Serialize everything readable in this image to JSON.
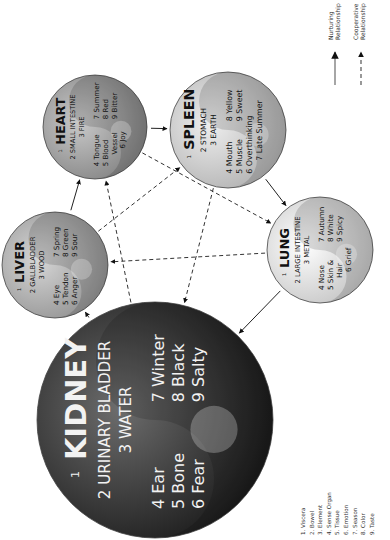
{
  "diagram": {
    "type": "five-element-viscera-diagram",
    "orientation": "rotated-90-ccw",
    "organs": [
      {
        "id": "heart",
        "viscera": "HEART",
        "bowel": "SMALL INTESTINE",
        "element": "FIRE",
        "sense_organ": "Tongue",
        "tissue": "Blood Vessel",
        "tissue_l1": "Blood",
        "tissue_l2": "Vessel",
        "emotion": "Joy",
        "season": "Summer",
        "color": "Red",
        "taste": "Bitter",
        "cx": 95,
        "cy": 127,
        "r": 52,
        "shade_light": "#c9c9c9",
        "shade_dark": "#7a7a7a",
        "text_color": "#111111"
      },
      {
        "id": "spleen",
        "viscera": "SPLEEN",
        "bowel": "STOMACH",
        "element": "EARTH",
        "sense_organ": "Mouth",
        "tissue": "Muscle",
        "emotion": "Overthinking",
        "season": "Late Summer",
        "color": "Yellow",
        "taste": "Sweet",
        "cx": 228,
        "cy": 130,
        "r": 58,
        "shade_light": "#eeeeee",
        "shade_dark": "#a9a9a9",
        "text_color": "#111111"
      },
      {
        "id": "liver",
        "viscera": "LIVER",
        "bowel": "GALLBLADDER",
        "element": "WOOD",
        "sense_organ": "Eye",
        "tissue": "Tendon",
        "emotion": "Anger",
        "season": "Spring",
        "color": "Green",
        "taste": "Sour",
        "cx": 55,
        "cy": 265,
        "r": 53,
        "shade_light": "#d6d6d6",
        "shade_dark": "#8a8a8a",
        "text_color": "#111111"
      },
      {
        "id": "lung",
        "viscera": "LUNG",
        "bowel": "LARGE INTESTINE",
        "element": "METAL",
        "sense_organ": "Nose",
        "tissue": "Skin & Hair",
        "tissue_l1": "Skin &",
        "tissue_l2": "Hair",
        "emotion": "Grief",
        "season": "Autumn",
        "color": "White",
        "taste": "Spicy",
        "cx": 320,
        "cy": 250,
        "r": 53,
        "shade_light": "#ffffff",
        "shade_dark": "#bdbdbd",
        "text_color": "#111111"
      },
      {
        "id": "kidney",
        "viscera": "KIDNEY",
        "bowel": "URINARY BLADDER",
        "element": "WATER",
        "sense_organ": "Ear",
        "tissue": "Bone",
        "emotion": "Fear",
        "season": "Winter",
        "color": "Black",
        "taste": "Salty",
        "cx": 155,
        "cy": 420,
        "r": 118,
        "shade_light": "#6d6d6d",
        "shade_dark": "#0f0f0f",
        "text_color": "#f2f2f2"
      }
    ],
    "nurturing_arrows": [
      {
        "from": "kidney",
        "to": "liver"
      },
      {
        "from": "liver",
        "to": "heart"
      },
      {
        "from": "heart",
        "to": "spleen"
      },
      {
        "from": "spleen",
        "to": "lung"
      },
      {
        "from": "lung",
        "to": "kidney"
      }
    ],
    "cooperative_arrows": [
      {
        "from": "kidney",
        "to": "heart"
      },
      {
        "from": "heart",
        "to": "lung"
      },
      {
        "from": "lung",
        "to": "liver"
      },
      {
        "from": "liver",
        "to": "spleen"
      },
      {
        "from": "spleen",
        "to": "kidney"
      }
    ],
    "numbers": {
      "n1": "1",
      "n2": "2",
      "n3": "3",
      "n4": "4",
      "n5": "5",
      "n6": "6",
      "n7": "7",
      "n8": "8",
      "n9": "9"
    }
  },
  "legend": {
    "nurturing_l1": "Nurturing",
    "nurturing_l2": "Relationship",
    "cooperative_l1": "Cooperative",
    "cooperative_l2": "Relationship"
  },
  "key": {
    "items": [
      "1. Viscera",
      "2. Bowel",
      "3. Element",
      "4. Sense Organ",
      "5. Tissue",
      "6. Emotion",
      "7. Season",
      "8. Color",
      "9. Taste"
    ]
  }
}
